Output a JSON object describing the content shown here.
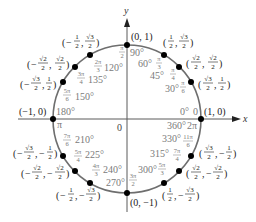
{
  "diagram": {
    "axes": {
      "x_label": "x",
      "y_label": "y",
      "origin_label": "0"
    },
    "colors": {
      "circle": "#6e6e6e",
      "axis": "#5a5a5a",
      "point": "#000000",
      "angle_text": "#7a7a7a",
      "coord_text": "#222222"
    },
    "points": [
      {
        "deg": "0°",
        "rad": "0",
        "rad_alt": "2π",
        "deg_alt": "360°",
        "coord": "(1, 0)"
      },
      {
        "deg": "30°",
        "rad_num": "π",
        "rad_den": "6",
        "coord_x_num": "√3",
        "coord_x_den": "2",
        "coord_y_num": "1",
        "coord_y_den": "2",
        "sign_x": "",
        "sign_y": ""
      },
      {
        "deg": "45°",
        "rad_num": "π",
        "rad_den": "4",
        "coord_x_num": "√2",
        "coord_x_den": "2",
        "coord_y_num": "√2",
        "coord_y_den": "2",
        "sign_x": "",
        "sign_y": ""
      },
      {
        "deg": "60°",
        "rad_num": "π",
        "rad_den": "3",
        "coord_x_num": "1",
        "coord_x_den": "2",
        "coord_y_num": "√3",
        "coord_y_den": "2",
        "sign_x": "",
        "sign_y": ""
      },
      {
        "deg": "90°",
        "rad_num": "π",
        "rad_den": "2",
        "coord": "(0, 1)"
      },
      {
        "deg": "120°",
        "rad_num": "2π",
        "rad_den": "3",
        "coord_x_num": "1",
        "coord_x_den": "2",
        "coord_y_num": "√3",
        "coord_y_den": "2",
        "sign_x": "−",
        "sign_y": ""
      },
      {
        "deg": "135°",
        "rad_num": "3π",
        "rad_den": "4",
        "coord_x_num": "√2",
        "coord_x_den": "2",
        "coord_y_num": "√2",
        "coord_y_den": "2",
        "sign_x": "−",
        "sign_y": ""
      },
      {
        "deg": "150°",
        "rad_num": "5π",
        "rad_den": "6",
        "coord_x_num": "√3",
        "coord_x_den": "2",
        "coord_y_num": "1",
        "coord_y_den": "2",
        "sign_x": "−",
        "sign_y": ""
      },
      {
        "deg": "180°",
        "rad": "π",
        "coord": "(−1, 0)"
      },
      {
        "deg": "210°",
        "rad_num": "7π",
        "rad_den": "6",
        "coord_x_num": "√3",
        "coord_x_den": "2",
        "coord_y_num": "1",
        "coord_y_den": "2",
        "sign_x": "−",
        "sign_y": "−"
      },
      {
        "deg": "225°",
        "rad_num": "5π",
        "rad_den": "4",
        "coord_x_num": "√2",
        "coord_x_den": "2",
        "coord_y_num": "√2",
        "coord_y_den": "2",
        "sign_x": "−",
        "sign_y": "−"
      },
      {
        "deg": "240°",
        "rad_num": "4π",
        "rad_den": "3",
        "coord_x_num": "1",
        "coord_x_den": "2",
        "coord_y_num": "√3",
        "coord_y_den": "2",
        "sign_x": "−",
        "sign_y": "−"
      },
      {
        "deg": "270°",
        "rad_num": "3π",
        "rad_den": "2",
        "coord": "(0, −1)"
      },
      {
        "deg": "300°",
        "rad_num": "5π",
        "rad_den": "3",
        "coord_x_num": "1",
        "coord_x_den": "2",
        "coord_y_num": "√3",
        "coord_y_den": "2",
        "sign_x": "",
        "sign_y": "−"
      },
      {
        "deg": "315°",
        "rad_num": "7π",
        "rad_den": "4",
        "coord_x_num": "√2",
        "coord_x_den": "2",
        "coord_y_num": "√2",
        "coord_y_den": "2",
        "sign_x": "",
        "sign_y": "−"
      },
      {
        "deg": "330°",
        "rad_num": "11π",
        "rad_den": "6",
        "coord_x_num": "√3",
        "coord_x_den": "2",
        "coord_y_num": "1",
        "coord_y_den": "2",
        "sign_x": "",
        "sign_y": "−"
      }
    ]
  }
}
